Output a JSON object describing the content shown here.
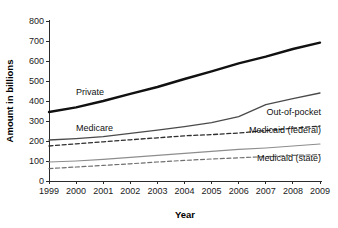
{
  "chart_data": {
    "type": "line",
    "title": "",
    "xlabel": "Year",
    "ylabel": "Amount in billions",
    "x": [
      1999,
      2000,
      2001,
      2002,
      2003,
      2004,
      2005,
      2006,
      2007,
      2008,
      2009
    ],
    "categories": [
      "1999",
      "2000",
      "2001",
      "2002",
      "2003",
      "2004",
      "2005",
      "2006",
      "2007",
      "2008",
      "2009"
    ],
    "xlim": [
      1999,
      2009
    ],
    "ylim": [
      0,
      800
    ],
    "yticks": [
      "0",
      "100",
      "200",
      "300",
      "400",
      "500",
      "600",
      "700",
      "800"
    ],
    "ytick_values": [
      0,
      100,
      200,
      300,
      400,
      500,
      600,
      700,
      800
    ],
    "ytick_step": 100,
    "grid": false,
    "legend_position": "inline-annotations",
    "series": [
      {
        "name": "Private",
        "label": "Private",
        "style": "solid",
        "color": "#111111",
        "width": 2.4,
        "label_side": "left",
        "values": [
          345,
          368,
          400,
          436,
          470,
          510,
          548,
          588,
          622,
          660,
          692
        ]
      },
      {
        "name": "Out-of-pocket",
        "label": "Out-of-pocket",
        "style": "solid",
        "color": "#4a4a4a",
        "width": 1.3,
        "label_side": "right",
        "values": [
          205,
          212,
          222,
          238,
          254,
          272,
          292,
          322,
          382,
          412,
          440
        ]
      },
      {
        "name": "Medicaid (federal)",
        "label": "Medicaid (federal)",
        "style": "dashed",
        "color": "#2e2e2e",
        "width": 1.3,
        "label_side": "right",
        "values": [
          175,
          186,
          196,
          206,
          216,
          226,
          232,
          240,
          252,
          264,
          275
        ]
      },
      {
        "name": "Medicare",
        "label": "Medicare",
        "style": "solid",
        "color": "#8d8d8d",
        "width": 1.2,
        "label_side": "left",
        "values": [
          95,
          100,
          108,
          118,
          128,
          138,
          148,
          158,
          165,
          175,
          185
        ]
      },
      {
        "name": "Medicaid (state)",
        "label": "Medicaid (state)",
        "style": "dashed",
        "color": "#6f6f6f",
        "width": 1.2,
        "label_side": "right",
        "values": [
          62,
          70,
          78,
          86,
          95,
          103,
          110,
          116,
          122,
          128,
          132
        ]
      }
    ],
    "annotations": [
      {
        "text": "Private",
        "x_value": 2000.0,
        "y_value": 430
      },
      {
        "text": "Medicare",
        "x_value": 2000.0,
        "y_value": 248
      },
      {
        "text": "Out-of-pocket",
        "x_value": 2009.0,
        "y_value": 330
      },
      {
        "text": "Medicaid (federal)",
        "x_value": 2009.0,
        "y_value": 240
      },
      {
        "text": "Medicaid (state)",
        "x_value": 2009.0,
        "y_value": 100
      }
    ]
  }
}
